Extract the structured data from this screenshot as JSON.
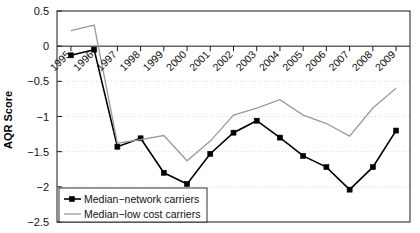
{
  "chart_data": {
    "type": "line",
    "title": "",
    "subtitle": "",
    "xlabel": "",
    "ylabel": "AQR Score",
    "xlim": [
      1994.4,
      2009.6
    ],
    "ylim": [
      -2.5,
      0.5
    ],
    "grid": true,
    "grid_style": "dotted-horizontal",
    "legend_position": "bottom-left",
    "categories": [
      1995,
      1996,
      1997,
      1998,
      1999,
      2000,
      2001,
      2002,
      2003,
      2004,
      2005,
      2006,
      2007,
      2008,
      2009
    ],
    "x_tick_labels": [
      "1995",
      "1996",
      "1997",
      "1998",
      "1999",
      "2000",
      "2001",
      "2002",
      "2003",
      "2004",
      "2005",
      "2006",
      "2007",
      "2008",
      "2009"
    ],
    "y_ticks": [
      0.5,
      0,
      -0.5,
      -1,
      -1.5,
      -2,
      -2.5
    ],
    "y_tick_labels": [
      "0.5",
      "0",
      "−0.5",
      "−1",
      "−1.5",
      "−2",
      "−2.5"
    ],
    "series": [
      {
        "name": "Median−network carriers",
        "color": "#000000",
        "marker": "square",
        "marker_size": 5,
        "line_width": 1.6,
        "values": [
          -0.13,
          -0.05,
          -1.43,
          -1.31,
          -1.8,
          -1.96,
          -1.53,
          -1.23,
          -1.06,
          -1.3,
          -1.56,
          -1.72,
          -2.04,
          -1.72,
          -1.2
        ]
      },
      {
        "name": "Median−low cost carriers",
        "color": "#9a9a9a",
        "marker": "none",
        "marker_size": 0,
        "line_width": 1.3,
        "values": [
          0.22,
          0.3,
          -1.38,
          -1.33,
          -1.27,
          -1.63,
          -1.35,
          -0.98,
          -0.88,
          -0.76,
          -0.98,
          -1.1,
          -1.28,
          -0.88,
          -0.6
        ]
      }
    ],
    "legend": [
      {
        "label": "Median−network carriers",
        "color": "#000000",
        "marker": "square"
      },
      {
        "label": "Median−low cost carriers",
        "color": "#9a9a9a",
        "marker": "none"
      }
    ]
  },
  "axes": {
    "y_axis_title": "AQR Score"
  }
}
